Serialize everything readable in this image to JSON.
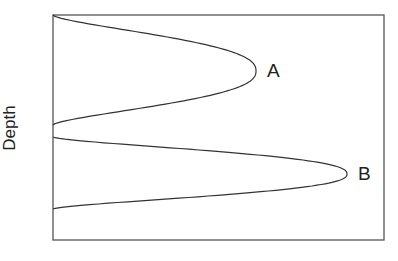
{
  "chart_data": {
    "type": "line",
    "title": "",
    "xlabel": "",
    "ylabel": "Depth",
    "grid": false,
    "frame": {
      "left": 53,
      "top": 15,
      "right": 384,
      "bottom": 240
    },
    "series": [
      {
        "name": "A",
        "label": "A",
        "description": "Bell-shaped lobe from top of axis, peaking at upper depth",
        "start_depth_px": 15,
        "peak_depth_px": 71,
        "end_depth_px": 125,
        "peak_x_px": 256
      },
      {
        "name": "B",
        "label": "B",
        "description": "Bell-shaped lobe at lower depth, extending further right",
        "start_depth_px": 137,
        "peak_depth_px": 174,
        "end_depth_px": 209,
        "peak_x_px": 347
      }
    ],
    "labels": {
      "A": "A",
      "B": "B"
    },
    "colors": {
      "line": "#333333",
      "frame": "#555555"
    }
  }
}
